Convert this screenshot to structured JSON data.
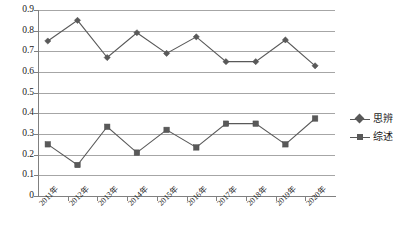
{
  "chart_data": {
    "type": "line",
    "title": "",
    "xlabel": "",
    "ylabel": "",
    "categories": [
      "2011年",
      "2012年",
      "2013年",
      "2014年",
      "2015年",
      "2016年",
      "2017年",
      "2018年",
      "2019年",
      "2020年"
    ],
    "series": [
      {
        "name": "思辨",
        "marker": "diamond",
        "color": "#595959",
        "values": [
          0.75,
          0.85,
          0.67,
          0.79,
          0.69,
          0.77,
          0.65,
          0.65,
          0.755,
          0.63
        ]
      },
      {
        "name": "综述",
        "marker": "square",
        "color": "#595959",
        "values": [
          0.25,
          0.15,
          0.335,
          0.21,
          0.32,
          0.235,
          0.35,
          0.35,
          0.25,
          0.375
        ]
      }
    ],
    "ylim": [
      0,
      0.9
    ],
    "yticks": [
      "0",
      "0.1",
      "0.2",
      "0.3",
      "0.4",
      "0.5",
      "0.6",
      "0.7",
      "0.8",
      "0.9"
    ],
    "ytick_values": [
      0,
      0.1,
      0.2,
      0.3,
      0.4,
      0.5,
      0.6,
      0.7,
      0.8,
      0.9
    ],
    "grid": true,
    "legend_position": "right"
  },
  "legend": {
    "items": [
      {
        "label": "思辨"
      },
      {
        "label": "综述"
      }
    ]
  }
}
